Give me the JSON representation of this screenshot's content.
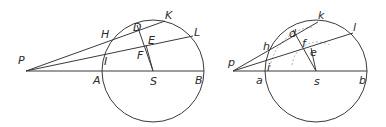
{
  "figures": [
    {
      "id": "left",
      "circle": {
        "cx": 153,
        "cy": 71,
        "r": 51
      },
      "points": {
        "P": [
          26,
          71
        ],
        "A": [
          102,
          71
        ],
        "S": [
          153,
          71
        ],
        "B": [
          204,
          71
        ],
        "H": [
          110,
          42
        ],
        "D": [
          137,
          25
        ],
        "K": [
          165,
          21
        ],
        "I": [
          106,
          55
        ],
        "E": [
          146,
          45
        ],
        "L": [
          193,
          36
        ],
        "F": [
          146,
          45
        ]
      },
      "labels": [
        {
          "text": "P",
          "x": 18,
          "y": 64
        },
        {
          "text": "H",
          "x": 101,
          "y": 38
        },
        {
          "text": "D",
          "x": 133,
          "y": 31
        },
        {
          "text": "K",
          "x": 165,
          "y": 19
        },
        {
          "text": "L",
          "x": 194,
          "y": 36
        },
        {
          "text": "E",
          "x": 148,
          "y": 44
        },
        {
          "text": "F",
          "x": 137,
          "y": 59
        },
        {
          "text": "I",
          "x": 104,
          "y": 65
        },
        {
          "text": "A",
          "x": 93,
          "y": 84
        },
        {
          "text": "S",
          "x": 150,
          "y": 85
        },
        {
          "text": "B",
          "x": 195,
          "y": 84
        }
      ]
    },
    {
      "id": "right",
      "circle": {
        "cx": 316,
        "cy": 71,
        "r": 51
      },
      "points": {
        "p": [
          233,
          71
        ],
        "a": [
          265,
          71
        ],
        "s": [
          316,
          71
        ],
        "b": [
          367,
          71
        ],
        "h": [
          268,
          47
        ],
        "d": [
          293,
          30
        ],
        "k": [
          318,
          22
        ],
        "i": [
          266,
          63
        ],
        "f": [
          301,
          49
        ],
        "e": [
          311,
          46
        ],
        "l": [
          353,
          33
        ]
      },
      "labels": [
        {
          "text": "p",
          "x": 228,
          "y": 66
        },
        {
          "text": "h",
          "x": 263,
          "y": 50
        },
        {
          "text": "d",
          "x": 289,
          "y": 37
        },
        {
          "text": "k",
          "x": 318,
          "y": 19
        },
        {
          "text": "l",
          "x": 353,
          "y": 31
        },
        {
          "text": "f",
          "x": 302,
          "y": 47
        },
        {
          "text": "e",
          "x": 310,
          "y": 56
        },
        {
          "text": "i",
          "x": 267,
          "y": 71
        },
        {
          "text": "a",
          "x": 256,
          "y": 84
        },
        {
          "text": "s",
          "x": 314,
          "y": 85
        },
        {
          "text": "b",
          "x": 359,
          "y": 84
        }
      ]
    }
  ]
}
